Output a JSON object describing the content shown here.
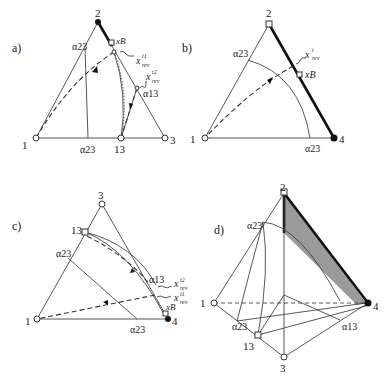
{
  "panels": {
    "a": {
      "label": "a)",
      "vertices": {
        "top": "2",
        "left": "1",
        "right": "3",
        "bottom_mid": "13"
      },
      "alpha_left": "α23",
      "alpha_bottom": "α23",
      "alpha_right": "α13",
      "x_B": "xB",
      "x_rev1": "x",
      "x_rev1_sup": "t1",
      "x_rev1_sub": "rev",
      "x_rev2": "x",
      "x_rev2_sup": "t2",
      "x_rev2_sub": "rev"
    },
    "b": {
      "label": "b)",
      "vertices": {
        "top": "2",
        "left": "1",
        "right": "4"
      },
      "alpha_left": "α23",
      "alpha_bottom": "α23",
      "x_B": "xB",
      "x_rev": "x",
      "x_rev_sup": "t",
      "x_rev_sub": "rev"
    },
    "c": {
      "label": "c)",
      "vertices": {
        "top": "3",
        "left": "1",
        "right": "4",
        "left_mid": "13"
      },
      "alpha_left": "α23",
      "alpha_bottom": "α23",
      "alpha_right": "α13",
      "x_B": "xB",
      "x_rev1": "x",
      "x_rev1_sup": "t1",
      "x_rev1_sub": "rev",
      "x_rev2": "x",
      "x_rev2_sup": "t2",
      "x_rev2_sub": "rev"
    },
    "d": {
      "label": "d)",
      "vertices": {
        "top": "2",
        "left": "1",
        "right": "4",
        "bottom": "3",
        "mid": "13"
      },
      "alpha_top": "α23",
      "alpha_left": "α23",
      "alpha_right": "α13",
      "shade_color": "#9a9a9a"
    }
  }
}
